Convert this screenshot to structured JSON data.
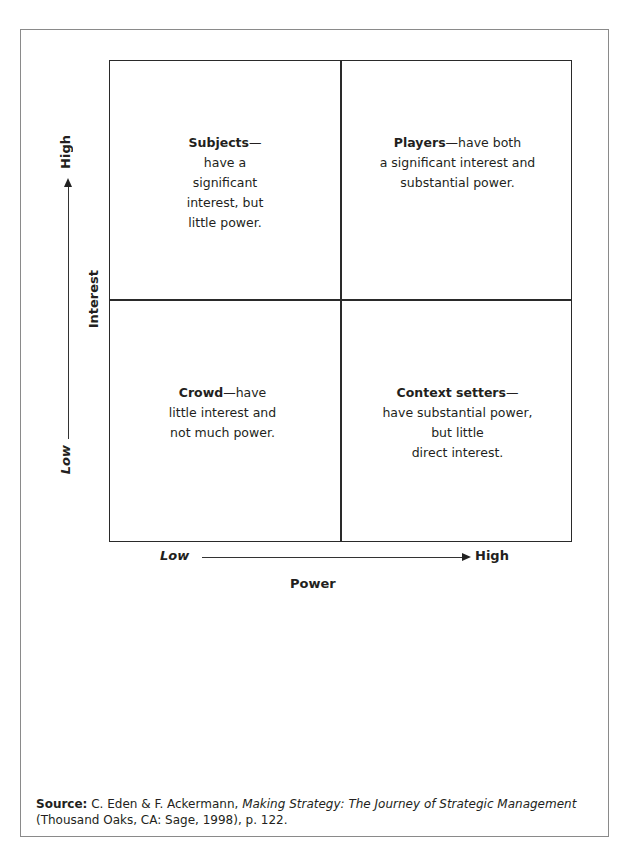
{
  "quadrants": {
    "top_left": {
      "name": "Subjects",
      "dash": "—",
      "lines": [
        "have a",
        "significant",
        "interest, but",
        "little power."
      ]
    },
    "top_right": {
      "name": "Players",
      "dash": "—have both",
      "lines": [
        "a significant interest and",
        "substantial power."
      ]
    },
    "bottom_left": {
      "name": "Crowd",
      "dash": "—have",
      "lines": [
        "little interest and",
        "not much power."
      ]
    },
    "bottom_right": {
      "name": "Context setters",
      "dash": "—",
      "lines": [
        "have substantial power,",
        "but little",
        "direct interest."
      ]
    }
  },
  "x_axis": {
    "low": "Low",
    "high": "High",
    "title": "Power"
  },
  "y_axis": {
    "low": "Low",
    "high": "High",
    "title": "Interest"
  },
  "source": {
    "label": "Source:",
    "authors": " C. Eden & F. Ackermann, ",
    "title": "Making Strategy: The Journey of Strategic Management",
    "publication": "(Thousand Oaks, CA: Sage, 1998), p. 122."
  }
}
